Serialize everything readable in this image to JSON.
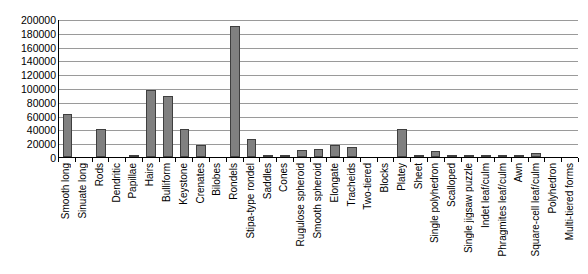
{
  "chart_data": {
    "type": "bar",
    "title": "",
    "xlabel": "",
    "ylabel": "",
    "ylim": [
      0,
      200000
    ],
    "ytick_step": 20000,
    "grid": true,
    "legend": "none",
    "bar_color": "#808080",
    "bar_border_color": "#3f3f3f",
    "axis_color": "#000000",
    "gridline_color": "#9a9a9a",
    "yticks": [
      "200000",
      "180000",
      "160000",
      "140000",
      "120000",
      "100000",
      "80000",
      "60000",
      "40000",
      "20000",
      "0"
    ],
    "categories": [
      "Smooth long",
      "Sinuate long",
      "Rods",
      "Dendritic",
      "Papillae",
      "Hairs",
      "Bulliform",
      "Keystone",
      "Crenates",
      "Bilobes",
      "Rondels",
      "Stipa-type rondel",
      "Saddles",
      "Cones",
      "Rugulose spheroid",
      "Smooth spheroid",
      "Elongate",
      "Tracheids",
      "Two-tiered",
      "Blocks",
      "Platey",
      "Sheet",
      "Single polyhedron",
      "Scalloped",
      "Single jigsaw puzzle",
      "Indet leaf/culm",
      "Phragmites leaf/culm",
      "Awn",
      "Square-cell leaf/culm",
      "Polyhedron",
      "Multi-tiered forms"
    ],
    "values": [
      62000,
      0,
      40000,
      0,
      3000,
      97000,
      88000,
      40000,
      18000,
      0,
      190000,
      26000,
      3000,
      2000,
      10000,
      12000,
      18000,
      14000,
      0,
      0,
      40000,
      3000,
      9000,
      2000,
      1000,
      1500,
      1000,
      1500,
      6000,
      500,
      500
    ]
  }
}
